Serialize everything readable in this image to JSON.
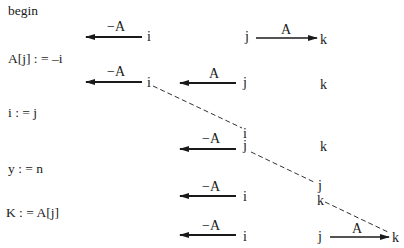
{
  "program": {
    "statements": [
      {
        "id": "begin",
        "text": "begin"
      },
      {
        "id": "assign-a",
        "text": "A[j] : = –i"
      },
      {
        "id": "assign-i",
        "text": "i : = j"
      },
      {
        "id": "assign-y",
        "text": "y : = n"
      },
      {
        "id": "assign-k",
        "text": "K : = A[j]"
      }
    ]
  },
  "diagram": {
    "nodes": {
      "r1_i": "i",
      "r1_j": "j",
      "r1_k": "k",
      "r2_i": "i",
      "r2_j": "j",
      "r2_k": "k",
      "r3_i": "i",
      "r3_j": "j",
      "r3_k": "k",
      "r4_i": "i",
      "r4_j": "j",
      "r4_k": "k",
      "r5_i": "i",
      "r5_j": "j",
      "r5_k": "k"
    },
    "edge_labels": {
      "r1_neg": "−A",
      "r1_pos": "A",
      "r2_neg": "−A",
      "r2_pos": "A",
      "r3_neg": "−A",
      "r4_neg": "−A",
      "r5_neg": "−A",
      "r5_pos": "A"
    },
    "stroke_color": "#1a1a1a"
  }
}
